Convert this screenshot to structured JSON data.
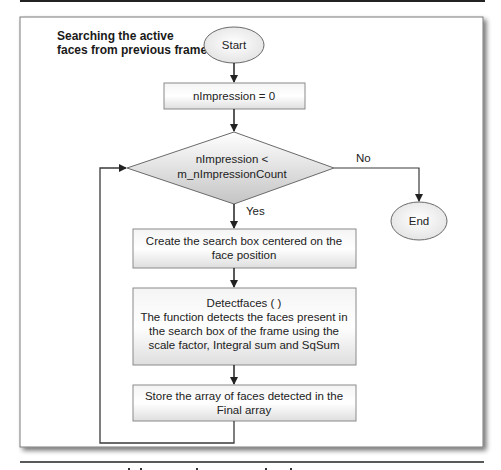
{
  "diagram": {
    "title_lines": [
      "Searching the active",
      "faces from previous frame"
    ],
    "nodes": {
      "start": {
        "type": "terminator",
        "label": "Start"
      },
      "init": {
        "type": "process",
        "label": "nImpression = 0"
      },
      "condition": {
        "type": "decision",
        "lines": [
          "nImpression <",
          "m_nImpressionCount"
        ]
      },
      "end": {
        "type": "terminator",
        "label": "End"
      },
      "create_box": {
        "type": "process",
        "lines": [
          "Create the search box centered on the",
          "face position"
        ]
      },
      "detect": {
        "type": "process",
        "lines": [
          "Detectfaces ( )",
          "The function detects the faces present in",
          "the search box of the frame using the",
          "scale factor, Integral sum and SqSum"
        ]
      },
      "store": {
        "type": "process",
        "lines": [
          "Store the array  of faces detected in the",
          "Final array"
        ]
      }
    },
    "edges": {
      "yes_label": "Yes",
      "no_label": "No"
    },
    "colors": {
      "line": "#3a3a3a",
      "box_border": "#8a8a8a",
      "fill_light": "#ffffff",
      "fill_grey": "#d4d4d4"
    }
  }
}
